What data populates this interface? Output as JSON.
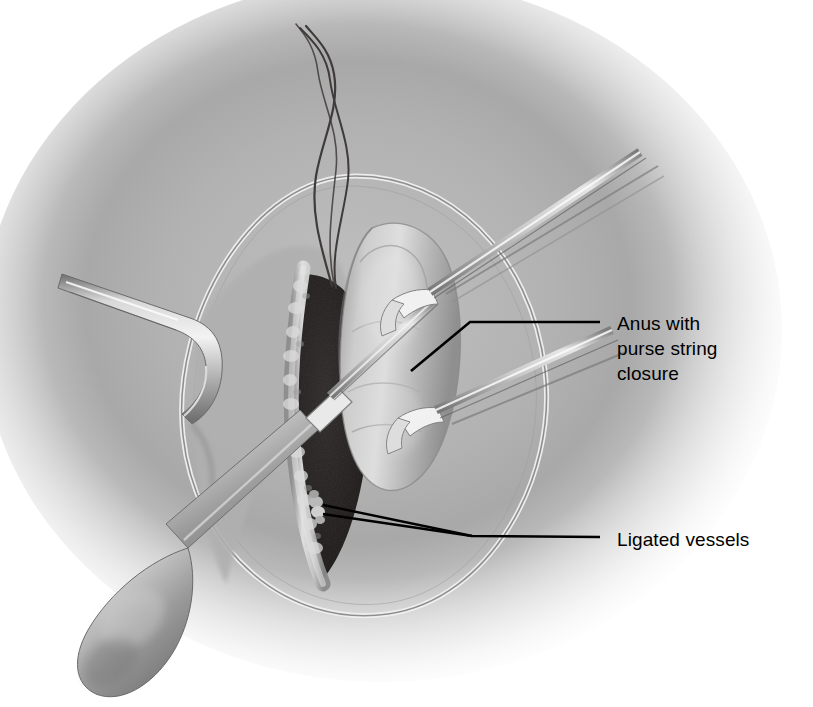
{
  "figure": {
    "kind": "medical-surgical-illustration",
    "background_color": "#ffffff",
    "tissue_color": "#a8a8a8",
    "wound_cavity_color": "#231f1e",
    "instrument_color": "#c9c9c9",
    "label_color": "#000000",
    "leader_color": "#000000"
  },
  "labels": [
    {
      "id": "anus",
      "name": "label-anus-with-purse-string-closure",
      "text": "Anus with\npurse string\nclosure",
      "x": 617,
      "y": 311,
      "leader": {
        "type": "elbow",
        "anchor_x": 411,
        "anchor_y": 371,
        "bend_x": 470,
        "bend_y": 322,
        "end_x": 600,
        "end_y": 322
      }
    },
    {
      "id": "vessels",
      "name": "label-ligated-vessels",
      "text": "Ligated vessels",
      "x": 617,
      "y": 527,
      "leader": {
        "type": "forked",
        "anchor_a_x": 323,
        "anchor_a_y": 505,
        "anchor_b_x": 323,
        "anchor_b_y": 514,
        "junction_x": 472,
        "junction_y": 536,
        "end_x": 600,
        "end_y": 537
      }
    }
  ],
  "structures": [
    {
      "id": "skin-oval",
      "name": "perineal-skin-oval-ring"
    },
    {
      "id": "wound-cavity",
      "name": "dark-wound-cavity"
    },
    {
      "id": "wound-edge",
      "name": "cut-tissue-edge"
    },
    {
      "id": "anal-stump",
      "name": "closed-anal-stump"
    },
    {
      "id": "ligated-vessels",
      "name": "ligated-vessel-knots"
    }
  ],
  "instruments": [
    {
      "id": "retractor-left",
      "name": "left-hook-retractor"
    },
    {
      "id": "cautery-pencil",
      "name": "electrocautery-pencil"
    },
    {
      "id": "clamp-upper",
      "name": "upper-right-tissue-clamp"
    },
    {
      "id": "clamp-lower",
      "name": "lower-right-tissue-clamp"
    },
    {
      "id": "suture-threads",
      "name": "purse-string-suture-threads"
    }
  ]
}
